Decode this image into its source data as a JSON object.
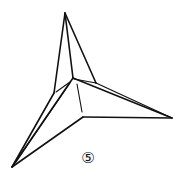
{
  "diagram": {
    "type": "origami-fold-step",
    "step_label": "⑤",
    "colors": {
      "stroke": "#111111",
      "background": "#ffffff"
    },
    "points": {
      "top": [
        65,
        13
      ],
      "center": [
        73,
        79
      ],
      "right": [
        172,
        118
      ],
      "bottom_left": [
        12,
        167
      ],
      "inner_bottom": [
        83,
        117
      ],
      "left_notch": [
        54,
        93
      ],
      "right_notch": [
        95,
        82
      ]
    }
  }
}
